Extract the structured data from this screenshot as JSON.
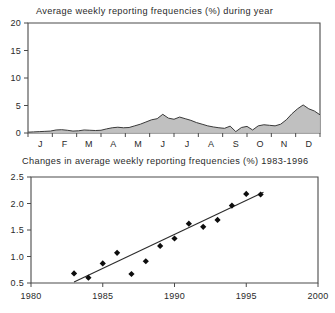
{
  "figure": {
    "background": "#ffffff",
    "ink_color": "#2a2a2a",
    "fill_color": "#bdbdbd"
  },
  "chart_data": [
    {
      "id": "seasonal-frequency",
      "type": "area",
      "title": "Average weekly reporting frequencies (%) during year",
      "xlabel": "",
      "ylabel": "",
      "grid": false,
      "legend": "none",
      "ylim": [
        0,
        20
      ],
      "yticks": [
        0,
        5,
        10,
        15,
        20
      ],
      "yticklabels": [
        "0",
        "5",
        "10",
        "15",
        "20"
      ],
      "xlim": [
        0,
        52
      ],
      "xticklabels": [
        "J",
        "F",
        "M",
        "A",
        "M",
        "J",
        "J",
        "A",
        "S",
        "O",
        "N",
        "D"
      ],
      "xtick_positions": [
        2.2,
        6.5,
        10.8,
        15.2,
        19.6,
        24.0,
        28.3,
        32.6,
        37.0,
        41.3,
        45.6,
        50.0
      ],
      "x_unit": "week of year",
      "series": [
        {
          "name": "Average weekly reporting frequency (%)",
          "x": [
            0,
            1,
            2,
            3,
            4,
            5,
            6,
            7,
            8,
            9,
            10,
            11,
            12,
            13,
            14,
            15,
            16,
            17,
            18,
            19,
            20,
            21,
            22,
            23,
            24,
            25,
            26,
            27,
            28,
            29,
            30,
            31,
            32,
            33,
            34,
            35,
            36,
            37,
            38,
            39,
            40,
            41,
            42,
            43,
            44,
            45,
            46,
            47,
            48,
            49,
            50,
            51,
            52
          ],
          "values": [
            0.15,
            0.2,
            0.25,
            0.3,
            0.35,
            0.55,
            0.6,
            0.5,
            0.35,
            0.4,
            0.55,
            0.5,
            0.45,
            0.5,
            0.75,
            0.95,
            1.05,
            0.95,
            1.0,
            1.3,
            1.6,
            2.0,
            2.4,
            2.6,
            3.4,
            2.7,
            2.5,
            2.9,
            2.6,
            2.3,
            1.9,
            1.6,
            1.3,
            1.1,
            0.95,
            0.85,
            1.25,
            0.25,
            1.0,
            1.2,
            0.55,
            1.3,
            1.5,
            1.4,
            1.3,
            1.6,
            2.4,
            3.5,
            4.4,
            5.1,
            4.4,
            4.0,
            3.3
          ]
        }
      ]
    },
    {
      "id": "annual-trend",
      "type": "scatter",
      "title": "Changes in average weekly reporting frequencies (%) 1983-1996",
      "xlabel": "",
      "ylabel": "",
      "grid": false,
      "legend": "none",
      "xlim": [
        1980,
        2000
      ],
      "xticks": [
        1980,
        1985,
        1990,
        1995,
        2000
      ],
      "xticklabels": [
        "1980",
        "1985",
        "1990",
        "1995",
        "2000"
      ],
      "ylim": [
        0.5,
        2.5
      ],
      "yticks": [
        0.5,
        1.0,
        1.5,
        2.0,
        2.5
      ],
      "yticklabels": [
        "0.5",
        "1.0",
        "1.5",
        "2.0",
        "2.5"
      ],
      "marker": "diamond",
      "series": [
        {
          "name": "Average weekly reporting frequency (%)",
          "x": [
            1983,
            1984,
            1985,
            1986,
            1987,
            1988,
            1989,
            1990,
            1991,
            1992,
            1993,
            1994,
            1995,
            1996
          ],
          "values": [
            0.68,
            0.6,
            0.87,
            1.07,
            0.67,
            0.91,
            1.2,
            1.34,
            1.62,
            1.56,
            1.69,
            1.96,
            2.18,
            2.17
          ]
        }
      ],
      "annotations": [
        {
          "type": "regression-line",
          "x_start": 1983,
          "y_start": 0.52,
          "x_end": 1996.2,
          "y_end": 2.21
        }
      ]
    }
  ]
}
